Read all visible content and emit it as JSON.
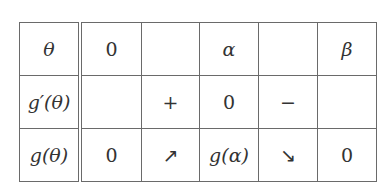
{
  "table": {
    "header": [
      "θ",
      "0",
      "",
      "α",
      "",
      "β"
    ],
    "rows": [
      {
        "label": "g′(θ)",
        "cells": [
          "",
          "+",
          "0",
          "−",
          ""
        ]
      },
      {
        "label": "g(θ)",
        "cells": [
          "0",
          "↗",
          "g(α)",
          "↘",
          "0"
        ]
      }
    ]
  }
}
